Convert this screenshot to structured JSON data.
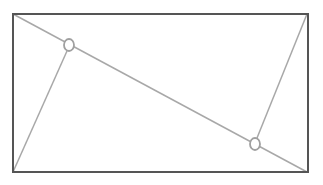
{
  "diagram": {
    "width": 323,
    "height": 185,
    "background": "#ffffff",
    "rectangle": {
      "x": 13,
      "y": 14,
      "width": 295,
      "height": 158,
      "stroke": "#555555",
      "stroke_width": 2
    },
    "lines": [
      {
        "id": "diagonal",
        "x1": 13,
        "y1": 14,
        "x2": 307,
        "y2": 172,
        "stroke": "#a8a8a8"
      },
      {
        "id": "bottom-left-to-point-1",
        "x1": 13,
        "y1": 172,
        "x2": 67,
        "y2": 51,
        "stroke": "#a8a8a8"
      },
      {
        "id": "top-right-to-point-2",
        "x1": 307,
        "y1": 14,
        "x2": 257,
        "y2": 138,
        "stroke": "#a8a8a8"
      }
    ],
    "points": [
      {
        "id": "point-1",
        "cx": 69,
        "cy": 45,
        "rx": 5,
        "ry": 6,
        "stroke": "#a0a0a0"
      },
      {
        "id": "point-2",
        "cx": 255,
        "cy": 144,
        "rx": 5,
        "ry": 6,
        "stroke": "#a0a0a0"
      }
    ]
  }
}
